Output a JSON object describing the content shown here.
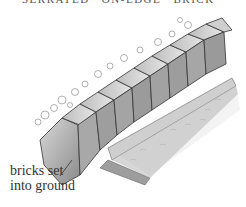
{
  "header": {
    "text": "SERRATED   ON-EDGE   BRICK"
  },
  "illustration": {
    "subject": "diagonal bricks set into ground forming serrated edging along a lawn",
    "style": "pencil sketch, grayscale"
  },
  "annotation": {
    "line1": "bricks set",
    "line2": "into ground"
  }
}
